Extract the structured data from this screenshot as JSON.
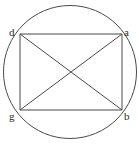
{
  "figure": {
    "background_color": "#ffffff",
    "stroke_color": "#4a4a4a",
    "label_color": "#2b2b2b",
    "circle": {
      "center_x": 70,
      "center_y": 72,
      "radius": 66.5,
      "stroke_width": 1
    },
    "vertices": [
      {
        "id": "d",
        "label": "d",
        "x": 20,
        "y": 34,
        "label_x": 9,
        "label_y": 27
      },
      {
        "id": "a",
        "label": "a",
        "x": 122,
        "y": 34,
        "label_x": 124,
        "label_y": 27
      },
      {
        "id": "g",
        "label": "g",
        "x": 20,
        "y": 110,
        "label_x": 9,
        "label_y": 111
      },
      {
        "id": "b",
        "label": "b",
        "x": 122,
        "y": 110,
        "label_x": 124,
        "label_y": 111
      }
    ],
    "edges": [
      {
        "name": "edge-d-a",
        "from": "d",
        "to": "a",
        "x1": 20,
        "y1": 34,
        "x2": 122,
        "y2": 34
      },
      {
        "name": "edge-a-b",
        "from": "a",
        "to": "b",
        "x1": 122,
        "y1": 34,
        "x2": 122,
        "y2": 110
      },
      {
        "name": "edge-b-g",
        "from": "b",
        "to": "g",
        "x1": 122,
        "y1": 110,
        "x2": 20,
        "y2": 110
      },
      {
        "name": "edge-g-d",
        "from": "g",
        "to": "d",
        "x1": 20,
        "y1": 110,
        "x2": 20,
        "y2": 34
      }
    ],
    "diagonals": [
      {
        "name": "diagonal-d-b",
        "from": "d",
        "to": "b",
        "x1": 20,
        "y1": 34,
        "x2": 122,
        "y2": 110
      },
      {
        "name": "diagonal-a-g",
        "from": "a",
        "to": "g",
        "x1": 122,
        "y1": 34,
        "x2": 20,
        "y2": 110
      }
    ]
  }
}
